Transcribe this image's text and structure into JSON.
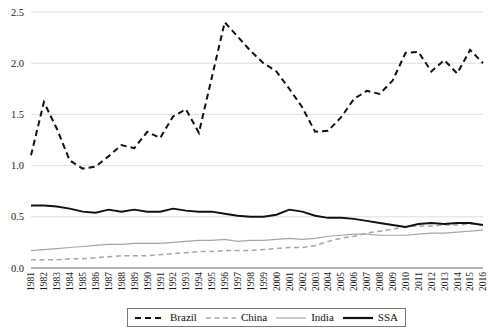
{
  "chart_data": {
    "type": "line",
    "title": "",
    "subtitle": "",
    "xlabel": "",
    "ylabel": "",
    "xlim": [
      1981,
      2016
    ],
    "ylim": [
      0.0,
      2.5
    ],
    "grid": true,
    "legend_position": "bottom",
    "ytick_labels": [
      "0.0",
      "0.5",
      "1.0",
      "1.5",
      "2.0",
      "2.5"
    ],
    "ytick_values": [
      0.0,
      0.5,
      1.0,
      1.5,
      2.0,
      2.5
    ],
    "x": [
      1981,
      1982,
      1983,
      1984,
      1985,
      1986,
      1987,
      1988,
      1989,
      1990,
      1991,
      1992,
      1993,
      1994,
      1995,
      1996,
      1997,
      1998,
      1999,
      2000,
      2001,
      2002,
      2003,
      2004,
      2005,
      2006,
      2007,
      2008,
      2009,
      2010,
      2011,
      2012,
      2013,
      2014,
      2015,
      2016
    ],
    "categories": [
      "1981",
      "1982",
      "1983",
      "1984",
      "1985",
      "1986",
      "1987",
      "1988",
      "1989",
      "1990",
      "1991",
      "1992",
      "1993",
      "1994",
      "1995",
      "1996",
      "1997",
      "1998",
      "1999",
      "2000",
      "2001",
      "2002",
      "2003",
      "2004",
      "2005",
      "2006",
      "2007",
      "2008",
      "2009",
      "2010",
      "2011",
      "2012",
      "2013",
      "2014",
      "2015",
      "2016"
    ],
    "series": [
      {
        "name": "Brazil",
        "style": "dashed",
        "color": "#111111",
        "values": [
          1.1,
          1.62,
          1.36,
          1.05,
          0.97,
          0.99,
          1.09,
          1.2,
          1.17,
          1.33,
          1.27,
          1.48,
          1.55,
          1.32,
          1.86,
          2.4,
          2.26,
          2.12,
          2.0,
          1.92,
          1.75,
          1.57,
          1.33,
          1.34,
          1.47,
          1.65,
          1.73,
          1.7,
          1.83,
          2.1,
          2.11,
          1.92,
          2.03,
          1.9,
          2.13,
          2.0
        ]
      },
      {
        "name": "China",
        "style": "dashed",
        "color": "#a6a6a6",
        "values": [
          0.08,
          0.08,
          0.08,
          0.09,
          0.09,
          0.1,
          0.11,
          0.12,
          0.12,
          0.12,
          0.13,
          0.14,
          0.15,
          0.16,
          0.16,
          0.17,
          0.17,
          0.17,
          0.18,
          0.19,
          0.2,
          0.2,
          0.22,
          0.26,
          0.29,
          0.31,
          0.34,
          0.36,
          0.38,
          0.4,
          0.41,
          0.41,
          0.42,
          0.42,
          0.43,
          0.42
        ]
      },
      {
        "name": "India",
        "style": "solid",
        "color": "#a6a6a6",
        "values": [
          0.17,
          0.18,
          0.19,
          0.2,
          0.21,
          0.22,
          0.23,
          0.23,
          0.24,
          0.24,
          0.24,
          0.25,
          0.26,
          0.27,
          0.27,
          0.28,
          0.26,
          0.27,
          0.27,
          0.28,
          0.29,
          0.28,
          0.29,
          0.31,
          0.32,
          0.33,
          0.33,
          0.32,
          0.32,
          0.32,
          0.33,
          0.34,
          0.34,
          0.35,
          0.36,
          0.37
        ]
      },
      {
        "name": "SSA",
        "style": "solid",
        "color": "#111111",
        "values": [
          0.61,
          0.61,
          0.6,
          0.58,
          0.55,
          0.54,
          0.57,
          0.55,
          0.57,
          0.55,
          0.55,
          0.58,
          0.56,
          0.55,
          0.55,
          0.53,
          0.51,
          0.5,
          0.5,
          0.52,
          0.57,
          0.55,
          0.51,
          0.49,
          0.49,
          0.48,
          0.46,
          0.44,
          0.42,
          0.4,
          0.43,
          0.44,
          0.43,
          0.44,
          0.44,
          0.42
        ]
      }
    ]
  },
  "legend": {
    "items": [
      {
        "label": "Brazil",
        "swatch": "dashed-black-bold"
      },
      {
        "label": "China",
        "swatch": "dashed-gray"
      },
      {
        "label": "India",
        "swatch": "solid-gray"
      },
      {
        "label": "SSA",
        "swatch": "solid-black-bold"
      }
    ]
  }
}
